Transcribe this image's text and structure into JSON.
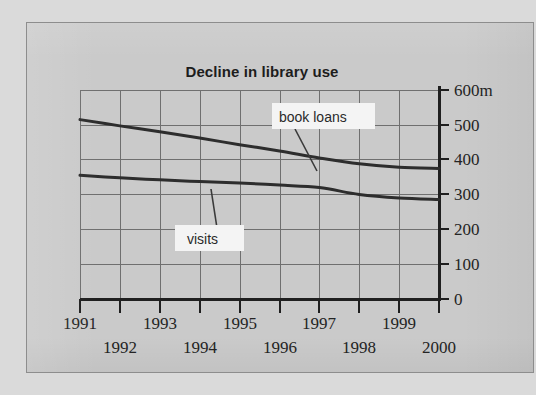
{
  "figure": {
    "background_color": "#cacaca",
    "page_color": "#dadada",
    "frame_border_color": "#8d8d8d"
  },
  "chart_data": {
    "type": "line",
    "title": "Decline in library use",
    "xlabel": "",
    "ylabel": "",
    "unit_suffix": "m",
    "grid": true,
    "legend": "inline-callouts",
    "x": [
      1991,
      1992,
      1993,
      1994,
      1995,
      1996,
      1997,
      1998,
      1999,
      2000
    ],
    "categories": [
      "1991",
      "1992",
      "1993",
      "1994",
      "1995",
      "1996",
      "1997",
      "1998",
      "1999",
      "2000"
    ],
    "xtick_labels_top_row": [
      "1991",
      "1993",
      "1995",
      "1997",
      "1999"
    ],
    "xtick_labels_bottom_row": [
      "1992",
      "1994",
      "1996",
      "1998",
      "2000"
    ],
    "ylim": [
      0,
      600
    ],
    "yticks": [
      0,
      100,
      200,
      300,
      400,
      500,
      600
    ],
    "ytick_labels": [
      "0",
      "100",
      "200",
      "300",
      "400",
      "500",
      "600m"
    ],
    "series": [
      {
        "name": "book loans",
        "values": [
          515,
          497,
          480,
          462,
          443,
          425,
          405,
          388,
          378,
          375
        ],
        "color": "#2d2d2d"
      },
      {
        "name": "visits",
        "values": [
          355,
          348,
          342,
          337,
          333,
          327,
          320,
          300,
          290,
          286
        ],
        "color": "#2d2d2d"
      }
    ],
    "annotations": [
      {
        "text": "book loans",
        "series": "book loans",
        "points_to_year": 1997
      },
      {
        "text": "visits",
        "series": "visits",
        "points_to_year": 1995
      }
    ]
  },
  "axis": {
    "y_axis_name": "millions",
    "x_axis_name": "year"
  }
}
